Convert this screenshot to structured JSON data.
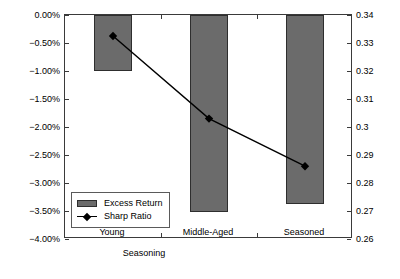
{
  "chart_data": {
    "type": "bar",
    "title": "",
    "categories": [
      "Young",
      "Middle-Aged",
      "Seasoned"
    ],
    "xlabel": "Seasoning",
    "grid": false,
    "legend_position": "lower-left-inside",
    "series": [
      {
        "name": "Excess Return",
        "type": "bar",
        "axis": "left",
        "values": [
          -1.0,
          -3.52,
          -3.38
        ],
        "unit": "%",
        "color": "#6b6b6b"
      },
      {
        "name": "Sharp Ratio",
        "type": "line",
        "axis": "right",
        "values": [
          0.3325,
          0.303,
          0.286
        ],
        "marker": "diamond",
        "color": "#000000"
      }
    ],
    "left_axis": {
      "label": "Excess Return (Annual)",
      "ylim": [
        -4.0,
        0.0
      ],
      "ticks": [
        0.0,
        -0.5,
        -1.0,
        -1.5,
        -2.0,
        -2.5,
        -3.0,
        -3.5,
        -4.0
      ],
      "tick_labels": [
        "0.00%",
        "-0.50%",
        "-1.00%",
        "-1.50%",
        "-2.00%",
        "-2.50%",
        "-3.00%",
        "-3.50%",
        "-4.00%"
      ]
    },
    "right_axis": {
      "label": "Sharp Ratio",
      "ylim": [
        0.26,
        0.34
      ],
      "ticks": [
        0.34,
        0.33,
        0.32,
        0.31,
        0.3,
        0.29,
        0.28,
        0.27,
        0.26
      ],
      "tick_labels": [
        "0.34",
        "0.33",
        "0.32",
        "0.31",
        "0.3",
        "0.29",
        "0.28",
        "0.27",
        "0.26"
      ]
    },
    "legend": [
      {
        "label": "Excess Return",
        "marker": "bar-swatch"
      },
      {
        "label": "Sharp Ratio",
        "marker": "line-diamond"
      }
    ]
  }
}
